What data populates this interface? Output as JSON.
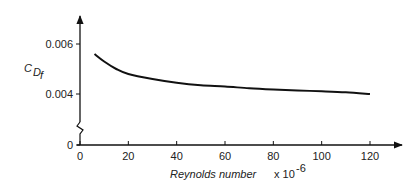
{
  "chart_data": {
    "type": "line",
    "title": "",
    "xlabel": "Reynolds number",
    "xlabel_suffix": "x 10",
    "xlabel_exp": "-6",
    "ylabel_main": "C",
    "ylabel_sub": "D",
    "ylabel_subsub": "f",
    "xlim": [
      0,
      130
    ],
    "ylim": [
      0,
      0.0075
    ],
    "y_axis_break": true,
    "grid": false,
    "x_ticks": [
      0,
      20,
      40,
      60,
      80,
      100,
      120
    ],
    "x_tick_labels": [
      "0",
      "20",
      "40",
      "60",
      "80",
      "100",
      "120"
    ],
    "y_ticks": [
      0,
      0.004,
      0.006
    ],
    "y_tick_labels": [
      "0",
      "0.004",
      "0.006"
    ],
    "series": [
      {
        "name": "C_Df",
        "x": [
          6,
          10,
          15,
          20,
          30,
          40,
          50,
          60,
          70,
          80,
          90,
          100,
          110,
          120
        ],
        "values": [
          0.0056,
          0.0053,
          0.005,
          0.0048,
          0.0046,
          0.00445,
          0.00435,
          0.0043,
          0.00423,
          0.00418,
          0.00414,
          0.00411,
          0.00407,
          0.004
        ]
      }
    ]
  }
}
